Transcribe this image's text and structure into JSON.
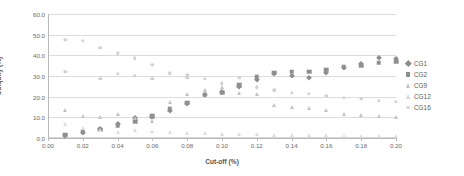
{
  "chart_data": {
    "type": "scatter",
    "title": "",
    "xlabel": "Cut-off (%)",
    "ylabel": "Ubiquity (%)",
    "xlim": [
      0.0,
      0.2
    ],
    "ylim": [
      0.0,
      60.0
    ],
    "xticks": [
      "0.00",
      "0.02",
      "0.04",
      "0.06",
      "0.08",
      "0.10",
      "0.12",
      "0.14",
      "0.16",
      "0.18",
      "0.20"
    ],
    "xtick_values": [
      0.0,
      0.02,
      0.04,
      0.06,
      0.08,
      0.1,
      0.12,
      0.14,
      0.16,
      0.18,
      0.2
    ],
    "yticks": [
      "0.0",
      "10.0",
      "20.0",
      "30.0",
      "40.0",
      "50.0",
      "60.0"
    ],
    "ytick_values": [
      0,
      10,
      20,
      30,
      40,
      50,
      60
    ],
    "grid": "horizontal",
    "legend_position": "right",
    "series": [
      {
        "name": "CG1",
        "marker": "diamond",
        "color": "#8d8d8d",
        "points": [
          [
            0.01,
            1.0
          ],
          [
            0.02,
            2.4
          ],
          [
            0.03,
            4.2
          ],
          [
            0.04,
            7.0
          ],
          [
            0.05,
            9.6
          ],
          [
            0.06,
            10.0
          ],
          [
            0.07,
            13.0
          ],
          [
            0.08,
            16.5
          ],
          [
            0.09,
            21.0
          ],
          [
            0.1,
            22.5
          ],
          [
            0.11,
            24.5
          ],
          [
            0.12,
            28.0
          ],
          [
            0.13,
            30.8
          ],
          [
            0.14,
            30.0
          ],
          [
            0.15,
            29.2
          ],
          [
            0.16,
            31.5
          ],
          [
            0.17,
            34.0
          ],
          [
            0.18,
            36.0
          ],
          [
            0.19,
            38.5
          ],
          [
            0.2,
            38.0
          ]
        ]
      },
      {
        "name": "CG2",
        "marker": "square",
        "color": "#8f8f8f",
        "points": [
          [
            0.01,
            1.5
          ],
          [
            0.02,
            3.0
          ],
          [
            0.03,
            4.0
          ],
          [
            0.04,
            6.0
          ],
          [
            0.05,
            8.0
          ],
          [
            0.06,
            10.5
          ],
          [
            0.07,
            14.0
          ],
          [
            0.08,
            17.0
          ],
          [
            0.09,
            21.0
          ],
          [
            0.1,
            22.0
          ],
          [
            0.11,
            25.5
          ],
          [
            0.12,
            29.5
          ],
          [
            0.13,
            31.5
          ],
          [
            0.14,
            32.0
          ],
          [
            0.15,
            32.0
          ],
          [
            0.16,
            33.0
          ],
          [
            0.17,
            34.5
          ],
          [
            0.18,
            35.0
          ],
          [
            0.19,
            36.5
          ],
          [
            0.2,
            37.0
          ]
        ]
      },
      {
        "name": "CG9",
        "marker": "triangle",
        "color": "#c4c4c4",
        "points": [
          [
            0.01,
            13.5
          ],
          [
            0.02,
            10.5
          ],
          [
            0.03,
            10.0
          ],
          [
            0.04,
            11.5
          ],
          [
            0.05,
            9.5
          ],
          [
            0.06,
            8.0
          ],
          [
            0.07,
            17.5
          ],
          [
            0.08,
            21.5
          ],
          [
            0.09,
            23.0
          ],
          [
            0.1,
            24.5
          ],
          [
            0.11,
            22.0
          ],
          [
            0.12,
            21.5
          ],
          [
            0.13,
            16.0
          ],
          [
            0.14,
            15.0
          ],
          [
            0.15,
            14.5
          ],
          [
            0.16,
            13.5
          ],
          [
            0.17,
            11.5
          ],
          [
            0.18,
            11.0
          ],
          [
            0.19,
            10.5
          ],
          [
            0.2,
            10.0
          ]
        ]
      },
      {
        "name": "CG12",
        "marker": "triangle",
        "color": "#dddddd",
        "points": [
          [
            0.01,
            7.0
          ],
          [
            0.02,
            5.0
          ],
          [
            0.03,
            4.0
          ],
          [
            0.04,
            3.0
          ],
          [
            0.05,
            3.8
          ],
          [
            0.06,
            3.2
          ],
          [
            0.07,
            2.8
          ],
          [
            0.08,
            2.5
          ],
          [
            0.09,
            2.2
          ],
          [
            0.1,
            2.0
          ],
          [
            0.11,
            1.8
          ],
          [
            0.12,
            1.8
          ],
          [
            0.13,
            1.6
          ],
          [
            0.14,
            1.5
          ],
          [
            0.15,
            1.4
          ],
          [
            0.16,
            1.3
          ],
          [
            0.17,
            1.2
          ],
          [
            0.18,
            1.2
          ],
          [
            0.19,
            1.0
          ],
          [
            0.2,
            1.0
          ]
        ]
      },
      {
        "name": "CG16",
        "marker": "circle",
        "color": "#d2d2d2",
        "points": [
          [
            0.01,
            47.5
          ],
          [
            0.02,
            47.0
          ],
          [
            0.03,
            43.5
          ],
          [
            0.04,
            41.0
          ],
          [
            0.05,
            38.5
          ],
          [
            0.06,
            35.5
          ],
          [
            0.07,
            31.0
          ],
          [
            0.08,
            30.5
          ],
          [
            0.09,
            28.5
          ],
          [
            0.1,
            26.5
          ],
          [
            0.11,
            29.0
          ],
          [
            0.12,
            24.5
          ],
          [
            0.13,
            23.0
          ],
          [
            0.14,
            22.0
          ],
          [
            0.15,
            21.5
          ],
          [
            0.16,
            20.5
          ],
          [
            0.17,
            19.5
          ],
          [
            0.18,
            19.0
          ],
          [
            0.19,
            18.0
          ],
          [
            0.2,
            17.5
          ]
        ]
      },
      {
        "name": "CG1b",
        "marker": "circle",
        "color": "#cfcfcf",
        "points": [
          [
            0.01,
            32.0
          ],
          [
            0.03,
            28.5
          ],
          [
            0.04,
            31.0
          ],
          [
            0.05,
            30.0
          ],
          [
            0.06,
            28.5
          ],
          [
            0.07,
            31.5
          ],
          [
            0.08,
            29.0
          ]
        ]
      }
    ]
  },
  "legend": {
    "items": [
      {
        "label": "CG1",
        "marker": "diamond",
        "color": "#8d8d8d"
      },
      {
        "label": "CG2",
        "marker": "square",
        "color": "#8f8f8f"
      },
      {
        "label": "CG9",
        "marker": "triangle",
        "color": "#c4c4c4"
      },
      {
        "label": "CG12",
        "marker": "triangle",
        "color": "#d6d6d6"
      },
      {
        "label": "CG16",
        "marker": "circle",
        "color": "#d8d8d8"
      }
    ]
  }
}
